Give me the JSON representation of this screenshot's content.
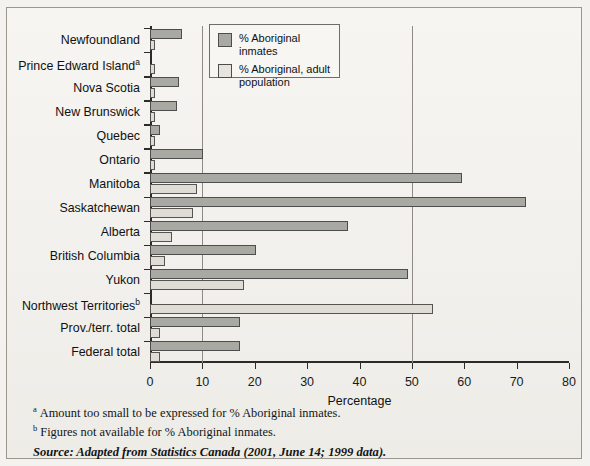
{
  "chart_data": {
    "type": "bar",
    "orientation": "horizontal",
    "title": "",
    "xlabel": "Percentage",
    "ylabel": "",
    "xlim": [
      0,
      80
    ],
    "xticks": [
      0,
      10,
      20,
      30,
      40,
      50,
      60,
      70,
      80
    ],
    "gridlines": [
      10,
      50
    ],
    "grid": true,
    "legend_position": "top-center",
    "categories": [
      "Newfoundland",
      "Prince Edward Island",
      "Nova Scotia",
      "New Brunswick",
      "Quebec",
      "Ontario",
      "Manitoba",
      "Saskatchewan",
      "Alberta",
      "British Columbia",
      "Yukon",
      "Northwest Territories",
      "Prov./terr. total",
      "Federal total"
    ],
    "category_footnotes": [
      "",
      "a",
      "",
      "",
      "",
      "",
      "",
      "",
      "",
      "",
      "",
      "b",
      "",
      ""
    ],
    "series": [
      {
        "name": "% Aboriginal inmates",
        "color": "#a9a9a4",
        "values": [
          6.1,
          null,
          5.5,
          5.2,
          2.0,
          10.1,
          59.5,
          71.8,
          37.8,
          20.2,
          49.2,
          null,
          17.2,
          17.2
        ]
      },
      {
        "name": "% Aboriginal, adult population",
        "color": "#dedcd4",
        "values": [
          1.0,
          1.0,
          0.8,
          0.9,
          1.0,
          1.0,
          9.0,
          8.3,
          4.2,
          2.9,
          17.9,
          54.0,
          1.9,
          1.9
        ]
      }
    ]
  },
  "legend": {
    "items": [
      {
        "label": "% Aboriginal inmates"
      },
      {
        "label": "% Aboriginal, adult population"
      }
    ]
  },
  "axis": {
    "xlabel": "Percentage",
    "ticklabels": [
      "0",
      "10",
      "20",
      "30",
      "40",
      "50",
      "60",
      "70",
      "80"
    ]
  },
  "notes": [
    {
      "marker": "a",
      "text": "Amount too small to be expressed for % Aboriginal inmates."
    },
    {
      "marker": "b",
      "text": "Figures not available for % Aboriginal inmates."
    }
  ],
  "source": "Source: Adapted from Statistics Canada (2001, June 14; 1999 data).",
  "colors": {
    "dark_bar": "#a9a9a4",
    "light_bar": "#dedcd4",
    "axis": "#2b2b2b",
    "frame": "#9a978f",
    "background": "#f3f2ee"
  }
}
